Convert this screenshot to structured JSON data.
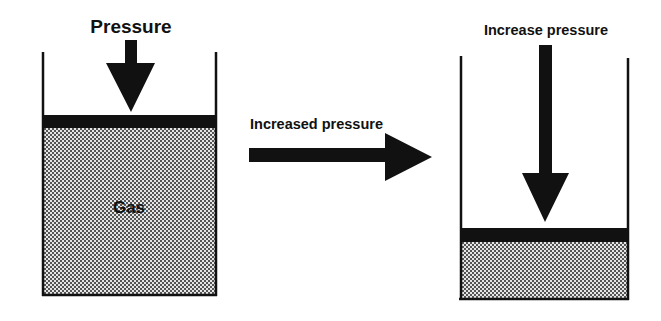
{
  "diagram": {
    "left_panel": {
      "top_label": "Pressure",
      "gas_label": "Gas"
    },
    "transition": {
      "label": "Increased pressure"
    },
    "right_panel": {
      "top_label": "Increase pressure"
    },
    "colors": {
      "ink": "#111111",
      "gas_fill": "#c8c8c8",
      "background": "#ffffff"
    }
  }
}
